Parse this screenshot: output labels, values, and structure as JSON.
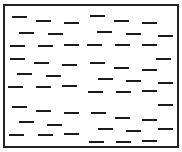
{
  "diagram": {
    "box": {
      "x": 3,
      "y": 4,
      "width": 172,
      "height": 140,
      "border": 2,
      "color": "#222222"
    },
    "dash_color": "#1a1a1a",
    "dash_length": 15,
    "dash_thickness": 2,
    "particles": [
      {
        "x": 12,
        "y": 16
      },
      {
        "x": 36,
        "y": 20
      },
      {
        "x": 64,
        "y": 22
      },
      {
        "x": 90,
        "y": 15
      },
      {
        "x": 114,
        "y": 20
      },
      {
        "x": 142,
        "y": 22
      },
      {
        "x": 19,
        "y": 32
      },
      {
        "x": 48,
        "y": 33
      },
      {
        "x": 97,
        "y": 31
      },
      {
        "x": 126,
        "y": 33
      },
      {
        "x": 158,
        "y": 35
      },
      {
        "x": 10,
        "y": 45
      },
      {
        "x": 38,
        "y": 45
      },
      {
        "x": 64,
        "y": 44
      },
      {
        "x": 87,
        "y": 44
      },
      {
        "x": 115,
        "y": 44
      },
      {
        "x": 142,
        "y": 44
      },
      {
        "x": 10,
        "y": 58
      },
      {
        "x": 34,
        "y": 62
      },
      {
        "x": 62,
        "y": 64
      },
      {
        "x": 90,
        "y": 62
      },
      {
        "x": 156,
        "y": 58
      },
      {
        "x": 114,
        "y": 67
      },
      {
        "x": 142,
        "y": 69
      },
      {
        "x": 17,
        "y": 73
      },
      {
        "x": 46,
        "y": 75
      },
      {
        "x": 98,
        "y": 78
      },
      {
        "x": 126,
        "y": 80
      },
      {
        "x": 158,
        "y": 82
      },
      {
        "x": 8,
        "y": 86
      },
      {
        "x": 36,
        "y": 86
      },
      {
        "x": 62,
        "y": 85
      },
      {
        "x": 88,
        "y": 91
      },
      {
        "x": 116,
        "y": 91
      },
      {
        "x": 142,
        "y": 90
      },
      {
        "x": 12,
        "y": 106
      },
      {
        "x": 36,
        "y": 110
      },
      {
        "x": 64,
        "y": 112
      },
      {
        "x": 91,
        "y": 112
      },
      {
        "x": 158,
        "y": 104
      },
      {
        "x": 115,
        "y": 117
      },
      {
        "x": 142,
        "y": 119
      },
      {
        "x": 19,
        "y": 121
      },
      {
        "x": 47,
        "y": 124
      },
      {
        "x": 98,
        "y": 128
      },
      {
        "x": 126,
        "y": 130
      },
      {
        "x": 158,
        "y": 128
      },
      {
        "x": 9,
        "y": 134
      },
      {
        "x": 38,
        "y": 134
      },
      {
        "x": 64,
        "y": 133
      },
      {
        "x": 89,
        "y": 141
      },
      {
        "x": 116,
        "y": 141
      },
      {
        "x": 142,
        "y": 140
      }
    ]
  }
}
